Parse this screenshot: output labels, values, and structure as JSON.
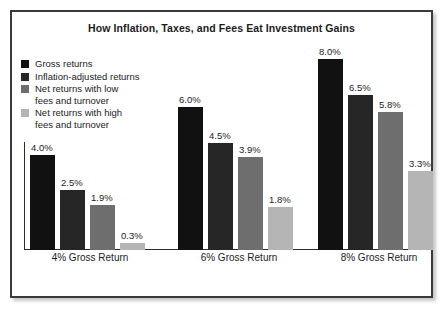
{
  "chart": {
    "title": "How Inflation, Taxes, and Fees Eat Investment Gains"
  },
  "legend": {
    "items": [
      {
        "label": "Gross returns",
        "color": "#111111"
      },
      {
        "label": "Inflation-adjusted returns",
        "color": "#262626"
      },
      {
        "label": "Net returns with low\nfees and turnover",
        "color": "#6e6e6e"
      },
      {
        "label": "Net returns with high\nfees and turnover",
        "color": "#b5b5b5"
      }
    ]
  },
  "chart_data": {
    "type": "bar",
    "title": "How Inflation, Taxes, and Fees Eat Investment Gains",
    "xlabel": "",
    "ylabel": "",
    "ylim": [
      0,
      8.8
    ],
    "grid": false,
    "legend_position": "top-left",
    "categories": [
      "4% Gross Return",
      "6% Gross Return",
      "8% Gross Return"
    ],
    "series": [
      {
        "name": "Gross returns",
        "color": "#111111",
        "values": [
          4.0,
          6.0,
          8.0
        ],
        "labels": [
          "4.0%",
          "6.0%",
          "8.0%"
        ]
      },
      {
        "name": "Inflation-adjusted returns",
        "color": "#262626",
        "values": [
          2.5,
          4.5,
          6.5
        ],
        "labels": [
          "2.5%",
          "4.5%",
          "6.5%"
        ]
      },
      {
        "name": "Net returns with low fees and turnover",
        "color": "#6e6e6e",
        "values": [
          1.9,
          3.9,
          5.8
        ],
        "labels": [
          "1.9%",
          "3.9%",
          "5.8%"
        ]
      },
      {
        "name": "Net returns with high fees and turnover",
        "color": "#b5b5b5",
        "values": [
          0.3,
          1.8,
          3.3
        ],
        "labels": [
          "0.3%",
          "1.8%",
          "3.3%"
        ]
      }
    ]
  }
}
